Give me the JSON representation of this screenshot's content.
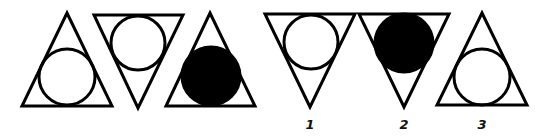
{
  "puzzle": {
    "description": "Figure sequence puzzle: triangle with inscribed circle",
    "stroke_color": "#000000",
    "fill_color": "#000000",
    "sequence": [
      {
        "triangle": "up",
        "circle": "outline"
      },
      {
        "triangle": "down",
        "circle": "outline"
      },
      {
        "triangle": "up",
        "circle": "filled"
      }
    ],
    "options": [
      {
        "label": "1",
        "triangle": "down",
        "circle": "outline"
      },
      {
        "label": "2",
        "triangle": "down",
        "circle": "filled"
      },
      {
        "label": "3",
        "triangle": "up",
        "circle": "outline"
      }
    ]
  }
}
